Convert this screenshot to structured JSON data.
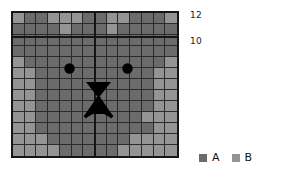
{
  "chart_data": {
    "type": "heatmap",
    "title": "",
    "xlabel": "",
    "ylabel": "",
    "rows": 13,
    "cols": 14,
    "categories_legend": [
      "A",
      "B"
    ],
    "value_colors": {
      "A": "#6b6b6b",
      "B": "#949494"
    },
    "y_tick_labels": [
      "12",
      "10"
    ],
    "x_tick_labels": [],
    "grid": true,
    "legend_position": "bottom-right",
    "matrix": [
      [
        "B",
        "A",
        "A",
        "B",
        "B",
        "B",
        "A",
        "A",
        "B",
        "B",
        "A",
        "A",
        "A",
        "B"
      ],
      [
        "A",
        "A",
        "A",
        "A",
        "B",
        "A",
        "A",
        "A",
        "B",
        "A",
        "A",
        "A",
        "A",
        "A"
      ],
      [
        "A",
        "A",
        "A",
        "A",
        "A",
        "A",
        "A",
        "A",
        "A",
        "A",
        "A",
        "A",
        "A",
        "A"
      ],
      [
        "A",
        "A",
        "A",
        "A",
        "A",
        "A",
        "A",
        "A",
        "A",
        "A",
        "A",
        "A",
        "A",
        "A"
      ],
      [
        "B",
        "A",
        "A",
        "A",
        "A",
        "A",
        "A",
        "A",
        "A",
        "A",
        "A",
        "A",
        "A",
        "B"
      ],
      [
        "B",
        "B",
        "A",
        "A",
        "A",
        "A",
        "A",
        "A",
        "A",
        "A",
        "A",
        "A",
        "B",
        "B"
      ],
      [
        "B",
        "B",
        "A",
        "A",
        "A",
        "A",
        "A",
        "A",
        "A",
        "A",
        "A",
        "A",
        "B",
        "B"
      ],
      [
        "B",
        "B",
        "A",
        "A",
        "A",
        "A",
        "A",
        "A",
        "A",
        "A",
        "A",
        "A",
        "B",
        "B"
      ],
      [
        "B",
        "B",
        "A",
        "A",
        "A",
        "A",
        "A",
        "A",
        "A",
        "A",
        "A",
        "A",
        "B",
        "B"
      ],
      [
        "B",
        "B",
        "A",
        "A",
        "A",
        "A",
        "A",
        "A",
        "A",
        "A",
        "A",
        "B",
        "B",
        "B"
      ],
      [
        "B",
        "B",
        "A",
        "A",
        "A",
        "A",
        "A",
        "A",
        "A",
        "A",
        "A",
        "A",
        "B",
        "B"
      ],
      [
        "B",
        "B",
        "B",
        "A",
        "A",
        "A",
        "A",
        "A",
        "A",
        "A",
        "B",
        "B",
        "B",
        "B"
      ],
      [
        "B",
        "B",
        "B",
        "B",
        "A",
        "A",
        "A",
        "A",
        "A",
        "B",
        "B",
        "B",
        "B",
        "B"
      ]
    ],
    "overlay": {
      "name": "cat-face",
      "color": "#000000",
      "features": [
        "left-eye",
        "right-eye",
        "nose-triangle",
        "whiskers"
      ]
    }
  },
  "axis": {
    "tick_12": "12",
    "tick_10": "10"
  },
  "legend": {
    "items": [
      {
        "label": "A",
        "color": "#6b6b6b"
      },
      {
        "label": "B",
        "color": "#949494"
      }
    ]
  }
}
